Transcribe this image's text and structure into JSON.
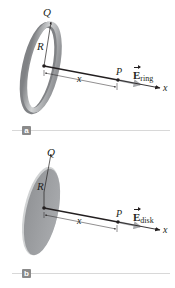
{
  "figure": {
    "panels": [
      {
        "id": "a",
        "badge": "a",
        "object": "ring",
        "labels": {
          "charge": "Q",
          "radius": "R",
          "distance": "x",
          "point": "P",
          "field_symbol": "E",
          "field_subscript": "ring",
          "axis": "x"
        }
      },
      {
        "id": "b",
        "badge": "b",
        "object": "disk",
        "labels": {
          "charge": "Q",
          "radius": "R",
          "distance": "x",
          "point": "P",
          "field_symbol": "E",
          "field_subscript": "disk",
          "axis": "x"
        }
      }
    ],
    "colors": {
      "object_gray": "#a7a9ac",
      "object_dark": "#808285",
      "object_light": "#d1d3d4",
      "field_arrow": "#a7a9ac",
      "line": "#231f20",
      "badge": "#8a8a8a",
      "rule": "#d8d8d8"
    }
  }
}
